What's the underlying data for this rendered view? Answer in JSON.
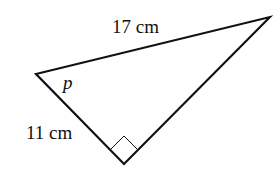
{
  "diagram": {
    "type": "right-triangle",
    "vertices": {
      "left": [
        36,
        74
      ],
      "right": [
        270,
        17
      ],
      "bottom": [
        124,
        164
      ]
    },
    "right_angle_at": "bottom",
    "stroke_color": "#111111",
    "background": "#ffffff",
    "labels": {
      "hypotenuse": "17 cm",
      "short_side": "11 cm",
      "angle": "p"
    }
  }
}
